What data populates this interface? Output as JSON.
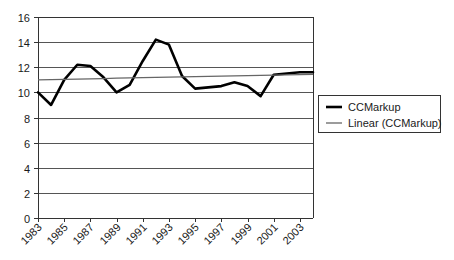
{
  "chart_data": {
    "type": "line",
    "title": "",
    "xlabel": "",
    "ylabel": "",
    "xlim": [
      1983,
      2004
    ],
    "ylim": [
      0,
      16
    ],
    "grid": true,
    "legend_position": "right",
    "y_ticks": [
      "0",
      "2",
      "4",
      "6",
      "8",
      "10",
      "12",
      "14",
      "16"
    ],
    "y_tick_values": [
      0,
      2,
      4,
      6,
      8,
      10,
      12,
      14,
      16
    ],
    "x_ticks": [
      "1983",
      "1985",
      "1987",
      "1989",
      "1991",
      "1993",
      "1995",
      "1997",
      "1999",
      "2001",
      "2003"
    ],
    "x_tick_values": [
      1983,
      1985,
      1987,
      1989,
      1991,
      1993,
      1995,
      1997,
      1999,
      2001,
      2003
    ],
    "x": [
      1983,
      1984,
      1985,
      1986,
      1987,
      1988,
      1989,
      1990,
      1991,
      1992,
      1993,
      1994,
      1995,
      1996,
      1997,
      1998,
      1999,
      2000,
      2001,
      2002,
      2003,
      2004
    ],
    "series": [
      {
        "name": "CCMarkup",
        "kind": "data",
        "color": "#000000",
        "values": [
          10.0,
          9.0,
          11.0,
          12.2,
          12.1,
          11.2,
          10.0,
          10.6,
          12.5,
          14.2,
          13.8,
          11.3,
          10.3,
          10.4,
          10.5,
          10.8,
          10.5,
          9.7,
          11.4,
          11.5,
          11.6,
          11.6
        ]
      },
      {
        "name": "Linear (CCMarkup)",
        "kind": "trend",
        "color": "#666666",
        "values": [
          11.0,
          11.02,
          11.04,
          11.06,
          11.08,
          11.1,
          11.13,
          11.15,
          11.17,
          11.19,
          11.21,
          11.23,
          11.25,
          11.27,
          11.29,
          11.31,
          11.33,
          11.35,
          11.37,
          11.39,
          11.41,
          11.43
        ]
      }
    ]
  },
  "legend": {
    "entries": [
      {
        "label": "CCMarkup",
        "swatch": "thick-black-line"
      },
      {
        "label": "Linear (CCMarkup)",
        "swatch": "thin-gray-line"
      }
    ]
  }
}
